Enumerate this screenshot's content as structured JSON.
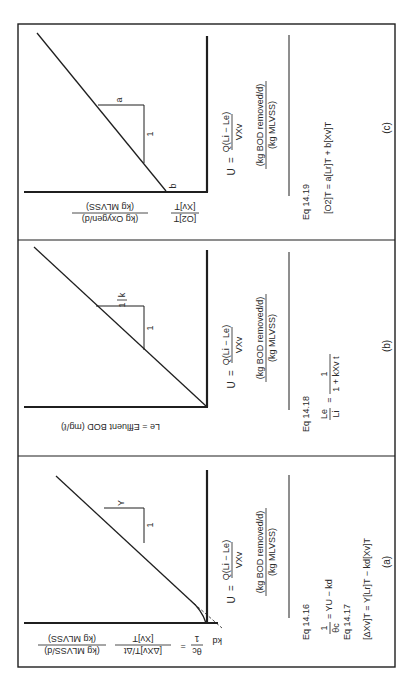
{
  "figure": {
    "orientation": "rotated 90 degrees clockwise",
    "panels": [
      {
        "id": "a",
        "label": "(a)",
        "y_axis": {
          "lhs": "1",
          "lhs_den": "θc",
          "eq": "=",
          "num": "[ΔXv]T/Δt",
          "den": "[Xv]T",
          "units_num": "(kg MLVSS/d)",
          "units_den": "(kg MLVSS)"
        },
        "intercept_label": "kd",
        "slope_label": "Y",
        "slope_run": "1",
        "x_axis": {
          "lhs": "U",
          "eq": "=",
          "num": "Q(Li − Le)",
          "den": "VXv",
          "units_num": "(kg BOD removed/d)",
          "units_den": "(kg MLVSS)"
        },
        "equations": [
          {
            "ref": "Eq  14.16",
            "text_left": "1",
            "text_left_den": "θc",
            "text_right": "= YU − kd"
          },
          {
            "ref": "Eq  14.17",
            "text": "[ΔXv]T  =  Y[Lr]T − kd[Xv]T"
          }
        ]
      },
      {
        "id": "b",
        "label": "(b)",
        "y_axis": {
          "text": "Le  =  Effluent BOD (mg/ℓ)"
        },
        "slope_label_num": "1",
        "slope_label_den": "k",
        "slope_run": "1",
        "x_axis": {
          "lhs": "U",
          "eq": "=",
          "num": "Q(Li − Le)",
          "den": "VXv",
          "units_num": "(kg BOD removed/d)",
          "units_den": "(kg MLVSS)"
        },
        "equations": [
          {
            "ref": "Eq  14.18",
            "lhs_num": "Le",
            "lhs_den": "Li",
            "eq": "=",
            "rhs_num": "1",
            "rhs_den": "1 + kXv t"
          }
        ]
      },
      {
        "id": "c",
        "label": "(c)",
        "y_axis": {
          "num": "[O2]T",
          "den": "[Xv]T",
          "units_num": "(kg Oxygen/d)",
          "units_den": "(kg MLVSS)"
        },
        "intercept_label": "b",
        "slope_label": "a",
        "slope_run": "1",
        "x_axis": {
          "lhs": "U",
          "eq": "=",
          "num": "Q(Li − Le)",
          "den": "VXv",
          "units_num": "(kg BOD removed/d)",
          "units_den": "(kg MLVSS)"
        },
        "equations": [
          {
            "ref": "Eq  14.19",
            "text": "[O2]T  =  a[Lr]T + b[Xv]T"
          }
        ]
      }
    ]
  },
  "colors": {
    "ink": "#1f1f1f",
    "background": "#ffffff"
  }
}
